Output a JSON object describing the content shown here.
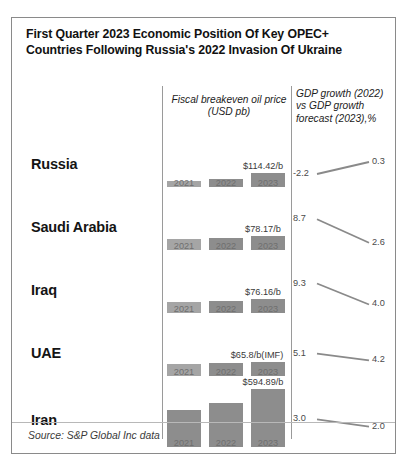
{
  "title": "First Quarter 2023 Economic Position Of Key OPEC+ Countries Following Russia's 2022 Invasion Of Ukraine",
  "headers": {
    "oil_price": "Fiscal breakeven oil price (USD pb)",
    "oil_price_line1": "Fiscal breakeven oil price",
    "oil_price_line2": "(USD pb)",
    "gdp_line1": "GDP growth (2022)",
    "gdp_line2": "vs GDP growth",
    "gdp_line3": "forecast (2023),%"
  },
  "source": "Source: S&P Global Inc data",
  "colors": {
    "bar": "#8d8d8d",
    "bar_light": "#a5a5a5",
    "line": "#8a8a8a",
    "border": "#8a8a8a",
    "text": "#1a1a1a"
  },
  "chart_data": {
    "type": "bar",
    "title": "First Quarter 2023 Economic Position Of Key OPEC+ Countries Following Russia's 2022 Invasion Of Ukraine",
    "categories": [
      "2021",
      "2022",
      "2023"
    ],
    "xlabel": "",
    "ylabel": "Fiscal breakeven oil price (USD pb)",
    "grid": false,
    "legend": "none",
    "rows": [
      {
        "country": "Russia",
        "bar_values": [
          52,
          64,
          114.42
        ],
        "bar_labels": [
          "2021",
          "2022",
          "2023"
        ],
        "value_label": "$114.42/b",
        "gdp_2022": "-2.2",
        "gdp_2023": "0.3",
        "gdp_2022_num": -2.2,
        "gdp_2023_num": 0.3,
        "trend": "up"
      },
      {
        "country": "Saudi Arabia",
        "bar_values": [
          60,
          66,
          78.17
        ],
        "bar_labels": [
          "2021",
          "2022",
          "2023"
        ],
        "value_label": "$78.17/b",
        "gdp_2022": "8.7",
        "gdp_2023": "2.6",
        "gdp_2022_num": 8.7,
        "gdp_2023_num": 2.6,
        "trend": "down"
      },
      {
        "country": "Iraq",
        "bar_values": [
          58,
          64,
          76.16
        ],
        "bar_labels": [
          "2021",
          "2022",
          "2023"
        ],
        "value_label": "$76.16/b",
        "gdp_2022": "9.3",
        "gdp_2023": "4.0",
        "gdp_2022_num": 9.3,
        "gdp_2023_num": 4.0,
        "trend": "down"
      },
      {
        "country": "UAE",
        "bar_values": [
          55,
          60,
          65.8
        ],
        "bar_labels": [
          "2021",
          "2022",
          "2023"
        ],
        "value_label": "$65.8/b(IMF)",
        "gdp_2022": "5.1",
        "gdp_2023": "4.2",
        "gdp_2022_num": 5.1,
        "gdp_2023_num": 4.2,
        "trend": "down"
      },
      {
        "country": "Iran",
        "bar_values": [
          380,
          450,
          594.89
        ],
        "bar_labels": [
          "2021",
          "2022",
          "2023"
        ],
        "value_label": "$594.89/b",
        "gdp_2022": "3.0",
        "gdp_2023": "2.0",
        "gdp_2022_num": 3.0,
        "gdp_2023_num": 2.0,
        "trend": "down"
      }
    ]
  }
}
